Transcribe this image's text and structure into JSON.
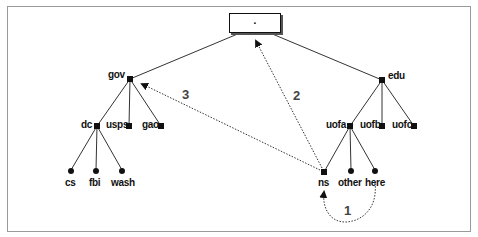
{
  "diagram": {
    "type": "dns-tree-resolution",
    "root": {
      "label": "."
    },
    "nodes": {
      "gov": "gov",
      "edu": "edu",
      "dc": "dc",
      "usps": "usps",
      "gao": "gao",
      "uofa": "uofa",
      "uofb": "uofb",
      "uofc": "uofc",
      "cs": "cs",
      "fbi": "fbi",
      "wash": "wash",
      "ns": "ns",
      "other": "other",
      "here": "here"
    },
    "steps": [
      {
        "label": "1",
        "from": "here",
        "to": "ns"
      },
      {
        "label": "2",
        "from": "ns",
        "to": "root"
      },
      {
        "label": "3",
        "from": "ns",
        "to": "gov"
      }
    ],
    "colors": {
      "line": "#333333",
      "node": "#111111",
      "border": "#9a9a9a"
    }
  }
}
